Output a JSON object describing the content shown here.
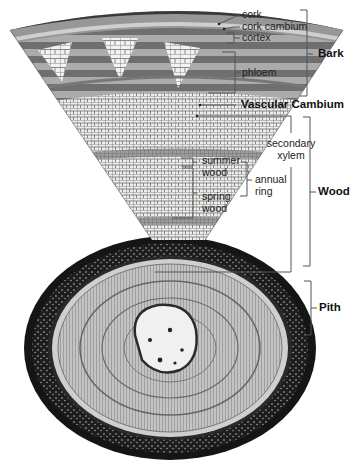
{
  "diagram": {
    "colors": {
      "cork": "#3a3a3a",
      "cortex": "#9a9a9a",
      "phloem_dark": "#6e6e6e",
      "phloem_light": "#a8a8a8",
      "ray_cells": "#e6e6e6",
      "xylem": "#b9b9b9",
      "xylem_cells": "#efefef",
      "summer_wood": "#8f8f8f",
      "outer_bark_ring": "#151515",
      "pith": "#f2f2f2",
      "leader_line": "#555555"
    },
    "labels": {
      "cork": "cork",
      "cork_cambium": "cork cambium",
      "cortex": "cortex",
      "phloem": "phloem",
      "bark": "Bark",
      "vascular_cambium": "Vascular Cambium",
      "secondary_xylem_1": "secondary",
      "secondary_xylem_2": "xylem",
      "summer_wood_1": "summer",
      "summer_wood_2": "wood",
      "spring_wood_1": "spring",
      "spring_wood_2": "wood",
      "annual_ring_1": "annual",
      "annual_ring_2": "ring",
      "wood": "Wood",
      "pith": "Pith"
    }
  }
}
